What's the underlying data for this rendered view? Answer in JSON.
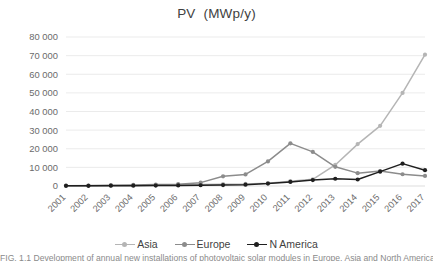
{
  "chart_data": {
    "type": "line",
    "title": "PV  (MWp/y)",
    "xlabel": "",
    "ylabel": "",
    "ylim": [
      0,
      80000
    ],
    "ytick_values": [
      0,
      10000,
      20000,
      30000,
      40000,
      50000,
      60000,
      70000,
      80000
    ],
    "ytick_labels": [
      "0",
      "10 000",
      "20 000",
      "30 000",
      "40 000",
      "50 000",
      "60 000",
      "70 000",
      "80 000"
    ],
    "grid": true,
    "legend_position": "bottom",
    "categories": [
      "2001",
      "2002",
      "2003",
      "2004",
      "2005",
      "2006",
      "2007",
      "2008",
      "2009",
      "2010",
      "2011",
      "2012",
      "2013",
      "2014",
      "2015",
      "2016",
      "2017"
    ],
    "series": [
      {
        "name": "Asia",
        "color": "#b5b5b5",
        "values": [
          200,
          250,
          300,
          400,
          500,
          600,
          800,
          1000,
          1100,
          1500,
          2600,
          3600,
          11300,
          22500,
          32300,
          50000,
          70500
        ]
      },
      {
        "name": "Europe",
        "color": "#8c8c8c",
        "values": [
          150,
          200,
          350,
          600,
          800,
          1000,
          1800,
          5200,
          6200,
          13200,
          22900,
          18300,
          10300,
          6900,
          8000,
          6300,
          5400
        ]
      },
      {
        "name": "N America",
        "color": "#1f1f1f",
        "values": [
          100,
          120,
          150,
          200,
          250,
          300,
          400,
          500,
          700,
          1300,
          2200,
          3200,
          3900,
          3500,
          7700,
          12000,
          8500
        ]
      }
    ]
  },
  "legend": {
    "items": [
      {
        "label": "Asia",
        "color": "#b5b5b5"
      },
      {
        "label": "Europe",
        "color": "#8c8c8c"
      },
      {
        "label": "N America",
        "color": "#1f1f1f"
      }
    ]
  },
  "caption": {
    "text": "FIG. 1.1 Development of annual new installations of photovoltaic solar modules in Europe, Asia and North America."
  }
}
